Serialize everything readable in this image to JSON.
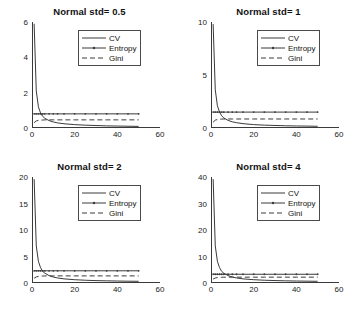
{
  "figure": {
    "background": "#ffffff",
    "line_color": "#3a3a3a",
    "axis_color": "#3a3a3a"
  },
  "legend": {
    "entries": [
      {
        "label": "CV",
        "style": "solid",
        "sample": "legend-sample-cv"
      },
      {
        "label": "Entropy",
        "style": "solid-marker",
        "sample": "legend-sample-entropy"
      },
      {
        "label": "Gini",
        "style": "dashed",
        "sample": "legend-sample-gini"
      }
    ]
  },
  "chart_data": [
    {
      "type": "line",
      "title": "Normal std= 0.5",
      "xlabel": "",
      "ylabel": "",
      "xlim": [
        0,
        60
      ],
      "ylim": [
        0,
        6
      ],
      "xticks": [
        0,
        20,
        40,
        60
      ],
      "yticks": [
        0,
        2,
        4,
        6
      ],
      "grid": false,
      "legend_position": "upper-center-right",
      "x": [
        1,
        2,
        3,
        4,
        5,
        6,
        8,
        10,
        12,
        15,
        20,
        25,
        30,
        35,
        40,
        45,
        50
      ],
      "series": [
        {
          "name": "CV",
          "style": "solid",
          "values": [
            5.9,
            2.1,
            1.2,
            0.85,
            0.66,
            0.55,
            0.42,
            0.34,
            0.29,
            0.24,
            0.19,
            0.16,
            0.14,
            0.12,
            0.11,
            0.1,
            0.09
          ]
        },
        {
          "name": "Entropy",
          "style": "solid-marker",
          "values": [
            0.8,
            0.8,
            0.8,
            0.8,
            0.8,
            0.8,
            0.8,
            0.8,
            0.8,
            0.8,
            0.8,
            0.8,
            0.8,
            0.8,
            0.8,
            0.8,
            0.8
          ]
        },
        {
          "name": "Gini",
          "style": "dashed",
          "values": [
            0.3,
            0.4,
            0.43,
            0.45,
            0.45,
            0.46,
            0.46,
            0.46,
            0.46,
            0.46,
            0.46,
            0.46,
            0.46,
            0.46,
            0.46,
            0.46,
            0.46
          ]
        }
      ]
    },
    {
      "type": "line",
      "title": "Normal std= 1",
      "xlabel": "",
      "ylabel": "",
      "xlim": [
        0,
        60
      ],
      "ylim": [
        0,
        10
      ],
      "xticks": [
        0,
        20,
        40,
        60
      ],
      "yticks": [
        0,
        5,
        10
      ],
      "grid": false,
      "legend_position": "upper-center-right",
      "x": [
        1,
        2,
        3,
        4,
        5,
        6,
        8,
        10,
        12,
        15,
        20,
        25,
        30,
        35,
        40,
        45,
        50
      ],
      "series": [
        {
          "name": "CV",
          "style": "solid",
          "values": [
            9.8,
            3.6,
            2.1,
            1.5,
            1.15,
            0.95,
            0.72,
            0.58,
            0.5,
            0.41,
            0.32,
            0.27,
            0.24,
            0.21,
            0.19,
            0.18,
            0.16
          ]
        },
        {
          "name": "Entropy",
          "style": "solid-marker",
          "values": [
            1.5,
            1.5,
            1.5,
            1.5,
            1.5,
            1.5,
            1.5,
            1.5,
            1.5,
            1.5,
            1.5,
            1.5,
            1.5,
            1.5,
            1.5,
            1.5,
            1.5
          ]
        },
        {
          "name": "Gini",
          "style": "dashed",
          "values": [
            0.55,
            0.74,
            0.8,
            0.83,
            0.84,
            0.85,
            0.85,
            0.85,
            0.85,
            0.85,
            0.85,
            0.85,
            0.85,
            0.85,
            0.85,
            0.85,
            0.85
          ]
        }
      ]
    },
    {
      "type": "line",
      "title": "Normal std= 2",
      "xlabel": "",
      "ylabel": "",
      "xlim": [
        0,
        60
      ],
      "ylim": [
        0,
        20
      ],
      "xticks": [
        0,
        20,
        40,
        60
      ],
      "yticks": [
        0,
        5,
        10,
        15,
        20
      ],
      "grid": false,
      "legend_position": "upper-center-right",
      "x": [
        1,
        2,
        3,
        4,
        5,
        6,
        8,
        10,
        12,
        15,
        20,
        25,
        30,
        35,
        40,
        45,
        50
      ],
      "series": [
        {
          "name": "CV",
          "style": "solid",
          "values": [
            19.6,
            7.0,
            4.1,
            2.9,
            2.2,
            1.85,
            1.4,
            1.12,
            0.95,
            0.78,
            0.62,
            0.52,
            0.45,
            0.41,
            0.37,
            0.34,
            0.32
          ]
        },
        {
          "name": "Entropy",
          "style": "solid-marker",
          "values": [
            2.3,
            2.3,
            2.3,
            2.3,
            2.3,
            2.3,
            2.3,
            2.3,
            2.3,
            2.3,
            2.3,
            2.3,
            2.3,
            2.3,
            2.3,
            2.3,
            2.3
          ]
        },
        {
          "name": "Gini",
          "style": "dashed",
          "values": [
            0.9,
            1.15,
            1.25,
            1.3,
            1.32,
            1.33,
            1.34,
            1.34,
            1.34,
            1.34,
            1.34,
            1.34,
            1.34,
            1.34,
            1.34,
            1.34,
            1.34
          ]
        }
      ]
    },
    {
      "type": "line",
      "title": "Normal std= 4",
      "xlabel": "",
      "ylabel": "",
      "xlim": [
        0,
        60
      ],
      "ylim": [
        0,
        40
      ],
      "xticks": [
        0,
        20,
        40,
        60
      ],
      "yticks": [
        0,
        10,
        20,
        30,
        40
      ],
      "grid": false,
      "legend_position": "upper-center-right",
      "x": [
        1,
        2,
        3,
        4,
        5,
        6,
        8,
        10,
        12,
        15,
        20,
        25,
        30,
        35,
        40,
        45,
        50
      ],
      "series": [
        {
          "name": "CV",
          "style": "solid",
          "values": [
            39.2,
            14.0,
            8.2,
            5.8,
            4.4,
            3.7,
            2.8,
            2.25,
            1.9,
            1.55,
            1.25,
            1.05,
            0.92,
            0.82,
            0.74,
            0.69,
            0.64
          ]
        },
        {
          "name": "Entropy",
          "style": "solid-marker",
          "values": [
            3.3,
            3.3,
            3.3,
            3.3,
            3.3,
            3.3,
            3.3,
            3.3,
            3.3,
            3.3,
            3.3,
            3.3,
            3.3,
            3.3,
            3.3,
            3.3,
            3.3
          ]
        },
        {
          "name": "Gini",
          "style": "dashed",
          "values": [
            1.5,
            1.9,
            2.05,
            2.12,
            2.16,
            2.18,
            2.2,
            2.2,
            2.2,
            2.2,
            2.2,
            2.2,
            2.2,
            2.2,
            2.2,
            2.2,
            2.2
          ]
        }
      ]
    }
  ]
}
